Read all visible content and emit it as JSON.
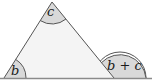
{
  "diagram": {
    "angles": {
      "bottom_left": "b",
      "top": "c",
      "exterior": "b + c"
    },
    "colors": {
      "triangle_fill": "#f4f4f4",
      "angle_fill": "#d9d9d9",
      "stroke": "#555555",
      "baseline": "#8a8a8a"
    }
  }
}
